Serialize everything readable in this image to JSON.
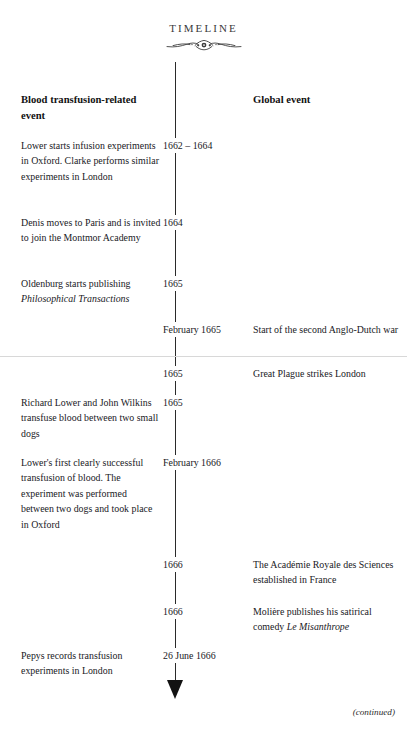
{
  "page": {
    "title": "TIMELINE",
    "ornament_icon": "flourish-ornament",
    "continued_note": "(continued)"
  },
  "columns": {
    "left_header": "Blood transfusion-related event",
    "date_header": "",
    "right_header": "Global event"
  },
  "colors": {
    "text": "#20201e",
    "heading": "#121212",
    "axis": "#2a2a2a",
    "divider": "#d8d8d8",
    "background": "#ffffff"
  },
  "rows": [
    {
      "top": 138,
      "date": "1662 – 1664",
      "left": "Lower starts infusion experiments in Oxford. Clarke performs similar experiments in London",
      "right": ""
    },
    {
      "top": 215,
      "date": "1664",
      "left": "Denis moves to Paris and is invited to join the Montmor Academy",
      "right": ""
    },
    {
      "top": 276,
      "date": "1665",
      "left_html": "Oldenburg starts publishing <em>Philosophical Transactions</em>",
      "left": "Oldenburg starts publishing Philosophical Transactions",
      "right": ""
    },
    {
      "top": 322,
      "date": "February 1665",
      "left": "",
      "right": "Start of the second Anglo-Dutch war"
    },
    {
      "top": 366,
      "date": "1665",
      "left": "",
      "right": "Great Plague strikes London"
    },
    {
      "top": 395,
      "date": "1665",
      "left": "Richard Lower and John Wilkins transfuse blood between two small dogs",
      "right": ""
    },
    {
      "top": 455,
      "date": "February 1666",
      "left": "Lower's first clearly successful transfusion of blood. The experiment was performed between two dogs and took place in Oxford",
      "right": ""
    },
    {
      "top": 557,
      "date": "1666",
      "left": "",
      "right": "The Académie Royale des Sciences established in France"
    },
    {
      "top": 604,
      "date": "1666",
      "left": "",
      "right_html": "Molière publishes his satirical comedy <em>Le Misanthrope</em>",
      "right": "Molière publishes his satirical comedy Le Misanthrope"
    },
    {
      "top": 648,
      "date": "26 June 1666",
      "left": "Pepys records transfusion experiments in London",
      "right": ""
    }
  ]
}
